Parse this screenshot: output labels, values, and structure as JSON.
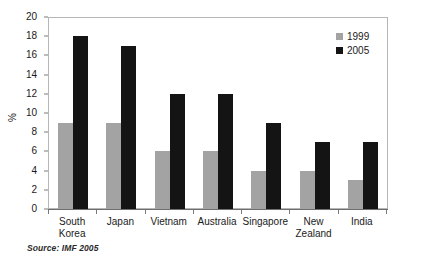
{
  "chart_data": {
    "type": "bar",
    "title": "",
    "subtitle": "",
    "xlabel": "",
    "ylabel": "%",
    "ylim": [
      0,
      20
    ],
    "ytick_step": 2,
    "yticks": [
      0,
      2,
      4,
      6,
      8,
      10,
      12,
      14,
      16,
      18,
      20
    ],
    "grid": false,
    "legend_position": "top-right",
    "categories": [
      "South Korea",
      "Japan",
      "Vietnam",
      "Australia",
      "Singapore",
      "New Zealand",
      "India"
    ],
    "category_lines": [
      [
        "South",
        "Korea"
      ],
      [
        "Japan"
      ],
      [
        "Vietnam"
      ],
      [
        "Australia"
      ],
      [
        "Singapore"
      ],
      [
        "New",
        "Zealand"
      ],
      [
        "India"
      ]
    ],
    "series": [
      {
        "name": "1999",
        "color": "#a3a3a3",
        "values": [
          9,
          9,
          6,
          6,
          4,
          4,
          3
        ]
      },
      {
        "name": "2005",
        "color": "#141414",
        "values": [
          18,
          17,
          12,
          12,
          9,
          7,
          7
        ]
      }
    ],
    "source_note": "Source:  IMF 2005"
  },
  "legend": {
    "items": [
      {
        "label": "1999",
        "swatch": "legend-swatch-gray"
      },
      {
        "label": "2005",
        "swatch": "legend-swatch-black"
      }
    ]
  }
}
